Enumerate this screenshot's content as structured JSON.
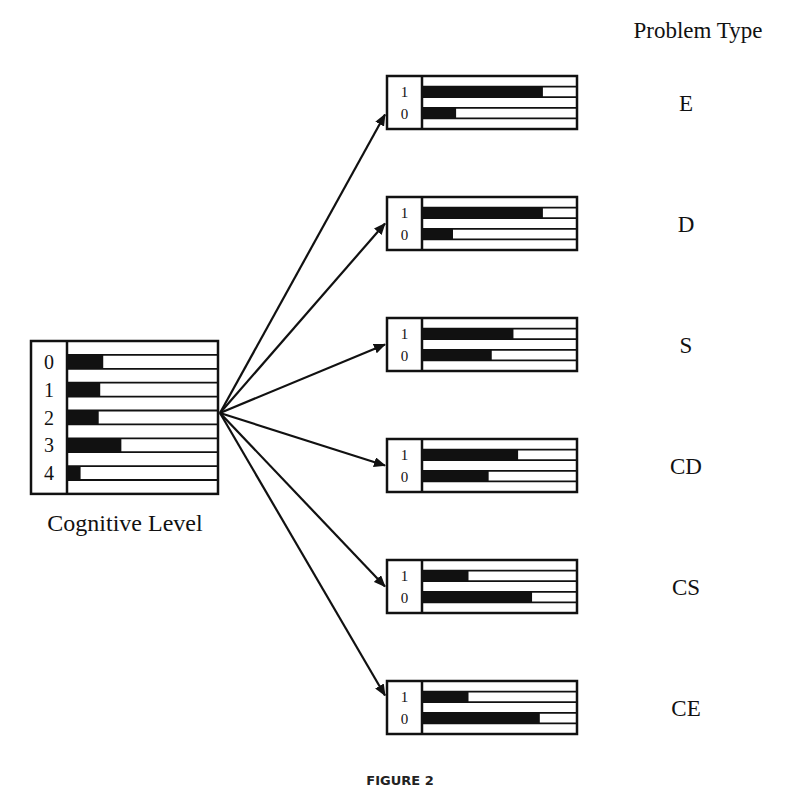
{
  "header": {
    "title": "Problem Type"
  },
  "figure_caption": "FIGURE 2",
  "parent_node": {
    "label": "Cognitive Level",
    "states": [
      {
        "state": "0",
        "fill": 0.24
      },
      {
        "state": "1",
        "fill": 0.22
      },
      {
        "state": "2",
        "fill": 0.21
      },
      {
        "state": "3",
        "fill": 0.36
      },
      {
        "state": "4",
        "fill": 0.09
      }
    ]
  },
  "child_nodes": [
    {
      "label": "E",
      "states": [
        {
          "state": "1",
          "fill": 0.78
        },
        {
          "state": "0",
          "fill": 0.22
        }
      ]
    },
    {
      "label": "D",
      "states": [
        {
          "state": "1",
          "fill": 0.78
        },
        {
          "state": "0",
          "fill": 0.2
        }
      ]
    },
    {
      "label": "S",
      "states": [
        {
          "state": "1",
          "fill": 0.59
        },
        {
          "state": "0",
          "fill": 0.45
        }
      ]
    },
    {
      "label": "CD",
      "states": [
        {
          "state": "1",
          "fill": 0.62
        },
        {
          "state": "0",
          "fill": 0.43
        }
      ]
    },
    {
      "label": "CS",
      "states": [
        {
          "state": "1",
          "fill": 0.3
        },
        {
          "state": "0",
          "fill": 0.71
        }
      ]
    },
    {
      "label": "CE",
      "states": [
        {
          "state": "1",
          "fill": 0.3
        },
        {
          "state": "0",
          "fill": 0.76
        }
      ]
    }
  ],
  "colors": {
    "ink": "#111111",
    "background": "#ffffff"
  }
}
